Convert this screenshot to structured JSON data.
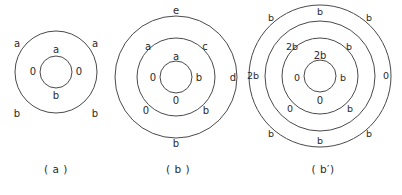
{
  "figure": {
    "background_color": "#ffffff",
    "stroke_color": "#4a4a4a",
    "text_color": "#2b2b2b",
    "panels": [
      {
        "id": "a",
        "caption": "( a )",
        "circles": [
          {
            "name": "outer-circle",
            "cx": 56,
            "cy": 72,
            "r": 41
          },
          {
            "name": "inner-circle",
            "cx": 56,
            "cy": 72,
            "r": 16
          }
        ],
        "labels": [
          {
            "name": "label-outer-top-left",
            "text": "a",
            "x": 17,
            "y": 44
          },
          {
            "name": "label-outer-top-right",
            "text": "a",
            "x": 95,
            "y": 44
          },
          {
            "name": "label-inner-top",
            "text": "a",
            "x": 56,
            "y": 50
          },
          {
            "name": "label-inner-left",
            "text": "0",
            "x": 33,
            "y": 72
          },
          {
            "name": "label-inner-right",
            "text": "0",
            "x": 79,
            "y": 72
          },
          {
            "name": "label-inner-bottom",
            "text": "b",
            "x": 56,
            "y": 96
          },
          {
            "name": "label-outer-bottom-left",
            "text": "b",
            "x": 17,
            "y": 114
          },
          {
            "name": "label-outer-bottom-right",
            "text": "b",
            "x": 95,
            "y": 114
          }
        ]
      },
      {
        "id": "b",
        "caption": "( b )",
        "circles": [
          {
            "name": "outer-circle",
            "cx": 64,
            "cy": 77,
            "r": 61
          },
          {
            "name": "middle-circle",
            "cx": 64,
            "cy": 77,
            "r": 39
          },
          {
            "name": "inner-circle",
            "cx": 64,
            "cy": 77,
            "r": 16
          }
        ],
        "labels": [
          {
            "name": "label-outer-top",
            "text": "e",
            "x": 64,
            "y": 11
          },
          {
            "name": "label-middle-top-left",
            "text": "a",
            "x": 36,
            "y": 47
          },
          {
            "name": "label-middle-top-right",
            "text": "c",
            "x": 93,
            "y": 47
          },
          {
            "name": "label-inner-top",
            "text": "a",
            "x": 64,
            "y": 57
          },
          {
            "name": "label-inner-left",
            "text": "0",
            "x": 41,
            "y": 78
          },
          {
            "name": "label-inner-right",
            "text": "b",
            "x": 87,
            "y": 78
          },
          {
            "name": "label-outer-right",
            "text": "d",
            "x": 121,
            "y": 78
          },
          {
            "name": "label-inner-bottom",
            "text": "0",
            "x": 64,
            "y": 101
          },
          {
            "name": "label-middle-bottom-left",
            "text": "0",
            "x": 34,
            "y": 111
          },
          {
            "name": "label-middle-bottom-right",
            "text": "b",
            "x": 94,
            "y": 111
          },
          {
            "name": "label-outer-bottom",
            "text": "b",
            "x": 64,
            "y": 144
          }
        ]
      },
      {
        "id": "bp",
        "caption": "( b′)",
        "circles": [
          {
            "name": "outer-circle",
            "cx": 76,
            "cy": 76,
            "r": 71
          },
          {
            "name": "second-circle",
            "cx": 76,
            "cy": 76,
            "r": 55
          },
          {
            "name": "third-circle",
            "cx": 76,
            "cy": 76,
            "r": 38
          },
          {
            "name": "inner-circle",
            "cx": 76,
            "cy": 76,
            "r": 16
          }
        ],
        "labels": [
          {
            "name": "label-outer-top-left",
            "text": "b",
            "x": 27,
            "y": 18
          },
          {
            "name": "label-second-top",
            "text": "b",
            "x": 76,
            "y": 12
          },
          {
            "name": "label-outer-top-right",
            "text": "b",
            "x": 125,
            "y": 18
          },
          {
            "name": "label-third-top-left",
            "text": "2b",
            "x": 48,
            "y": 47
          },
          {
            "name": "label-third-top-right",
            "text": "b",
            "x": 105,
            "y": 47
          },
          {
            "name": "label-inner-top",
            "text": "2b",
            "x": 76,
            "y": 56
          },
          {
            "name": "label-outer-left",
            "text": "2b",
            "x": 9,
            "y": 76
          },
          {
            "name": "label-inner-left",
            "text": "0",
            "x": 53,
            "y": 78
          },
          {
            "name": "label-inner-right",
            "text": "b",
            "x": 99,
            "y": 78
          },
          {
            "name": "label-outer-right",
            "text": "0",
            "x": 142,
            "y": 76
          },
          {
            "name": "label-inner-bottom",
            "text": "0",
            "x": 76,
            "y": 101
          },
          {
            "name": "label-third-bottom-left",
            "text": "0",
            "x": 46,
            "y": 109
          },
          {
            "name": "label-third-bottom-right",
            "text": "b",
            "x": 106,
            "y": 109
          },
          {
            "name": "label-outer-bottom-left",
            "text": "b",
            "x": 27,
            "y": 134
          },
          {
            "name": "label-second-bottom",
            "text": "b",
            "x": 76,
            "y": 141
          },
          {
            "name": "label-outer-bottom-right",
            "text": "b",
            "x": 125,
            "y": 134
          }
        ]
      }
    ]
  }
}
